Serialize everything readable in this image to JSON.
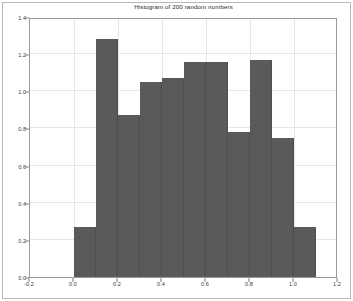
{
  "figure": {
    "title": "Histogram of 200 random numbers",
    "background_color": "#ffffff",
    "frame_color": "#b9b9b9",
    "axes_color": "#9a9a9a",
    "grid_color": "#e6e6e6",
    "bar_color": "#5a5a5a",
    "bar_edge_color": "#4e4e4e"
  },
  "axes": {
    "x_tick_labels": [
      "-0.2",
      "0.0",
      "0.2",
      "0.4",
      "0.6",
      "0.8",
      "1.0",
      "1.2"
    ],
    "x_tick_values": [
      -0.2,
      0.0,
      0.2,
      0.4,
      0.6,
      0.8,
      1.0,
      1.2
    ],
    "y_tick_labels": [
      "0.0",
      "0.2",
      "0.4",
      "0.6",
      "0.8",
      "1.0",
      "1.2",
      "1.4"
    ],
    "y_tick_values": [
      0.0,
      0.2,
      0.4,
      0.6,
      0.8,
      1.0,
      1.2,
      1.4
    ]
  },
  "chart_data": {
    "type": "bar",
    "title": "Histogram of 200 random numbers",
    "xlabel": "",
    "ylabel": "",
    "xlim": [
      -0.2,
      1.2
    ],
    "ylim": [
      0.0,
      1.4
    ],
    "grid": true,
    "legend": false,
    "bin_width": 0.1,
    "bin_edges": [
      0.0,
      0.1,
      0.2,
      0.3,
      0.4,
      0.5,
      0.6,
      0.7,
      0.8,
      0.9,
      1.0,
      1.1
    ],
    "categories": [
      "0.0-0.1",
      "0.1-0.2",
      "0.2-0.3",
      "0.3-0.4",
      "0.4-0.5",
      "0.5-0.6",
      "0.6-0.7",
      "0.7-0.8",
      "0.8-0.9",
      "0.9-1.0",
      "1.0-1.1"
    ],
    "values": [
      0.27,
      1.28,
      0.87,
      1.05,
      1.07,
      1.16,
      1.16,
      0.78,
      1.17,
      0.75,
      0.27
    ]
  }
}
